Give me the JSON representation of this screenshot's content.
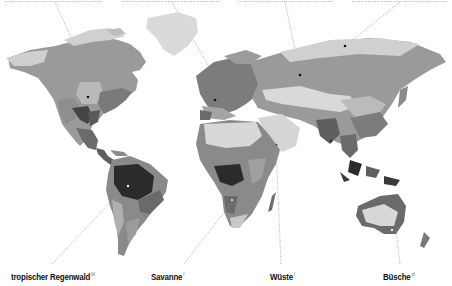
{
  "map": {
    "type": "world biome map",
    "colors": {
      "tundra": "#d6d6d6",
      "taiga": "#9a9a9a",
      "temperate_forest": "#7c7c7c",
      "grassland": "#b4b4b4",
      "desert": "#d9d9d9",
      "savanna": "#8a8a8a",
      "shrubland": "#5e5e5e",
      "rainforest": "#2b2b2b",
      "ice": "#e4e4e4",
      "leader_line": "#9a9a9a",
      "marker": "#111111"
    }
  },
  "labels": {
    "bottom": [
      {
        "text": "tropischer Regenwald",
        "sup": "W"
      },
      {
        "text": "Savanne",
        "sup": "f"
      },
      {
        "text": "Wüste",
        "sup": "f"
      },
      {
        "text": "Büsche",
        "sup": "pl"
      }
    ]
  }
}
